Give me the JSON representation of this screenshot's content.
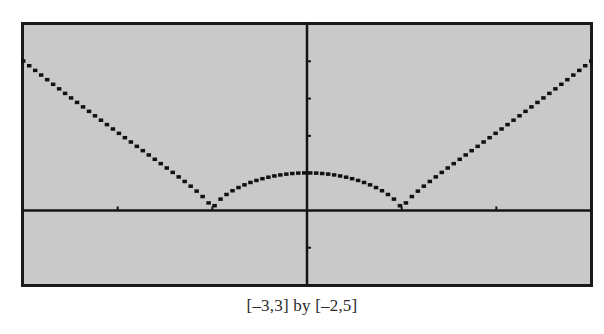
{
  "chart_data": {
    "type": "line",
    "title": "",
    "function": "y = |x^2 - 1|^(2/3)",
    "xlabel": "",
    "ylabel": "",
    "xlim": [
      -3,
      3
    ],
    "ylim": [
      -2,
      5
    ],
    "xscale": 1,
    "yscale": 1,
    "grid": false,
    "legend": "none",
    "series": [
      {
        "name": "graph",
        "x": [
          -3,
          -2.5,
          -2,
          -1.5,
          -1,
          -0.5,
          0,
          0.5,
          1,
          1.5,
          2,
          2.5,
          3
        ],
        "values": [
          4.0,
          3.08,
          2.08,
          1.25,
          0,
          0.83,
          1.0,
          0.83,
          0,
          1.25,
          2.08,
          3.08,
          4.0
        ]
      }
    ],
    "annotations": [
      "cusps at x = -1 and x = 1",
      "local maximum at (0, 1)"
    ]
  },
  "caption": "[–3,3] by [–2,5]",
  "colors": {
    "screen_bg": "#c9c9c9",
    "frame": "#1a1a1a",
    "axis": "#151515",
    "curve": "#111111"
  },
  "window": {
    "xmin": -3,
    "xmax": 3,
    "ymin": -2,
    "ymax": 5
  }
}
